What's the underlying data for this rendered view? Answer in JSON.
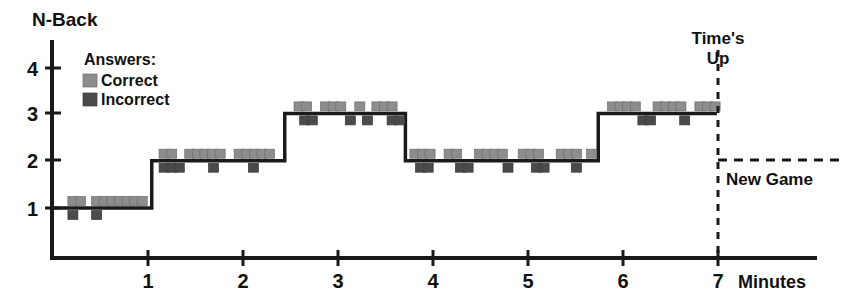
{
  "chart_data": {
    "type": "line",
    "title": "",
    "ylabel": "N-Back",
    "xlabel": "Minutes",
    "xlim": [
      0,
      8.0
    ],
    "ylim": [
      0,
      4.6
    ],
    "grid": false,
    "x_ticks": [
      1,
      2,
      3,
      4,
      5,
      6,
      7
    ],
    "x_tick_labels": [
      "1",
      "2",
      "3",
      "4",
      "5",
      "6",
      "7"
    ],
    "y_ticks": [
      1,
      2,
      3,
      4
    ],
    "y_tick_labels": [
      "1",
      "2",
      "3",
      "4"
    ],
    "legend": {
      "title": "Answers:",
      "position": "upper-left-inside",
      "entries": [
        {
          "label": "Correct",
          "color": "#8d8d8d"
        },
        {
          "label": "Incorrect",
          "color": "#4a4a4a"
        }
      ]
    },
    "series": [
      {
        "name": "N-Back level",
        "type": "step",
        "steps": [
          {
            "x_start": 0.0,
            "x_end": 1.05,
            "level": 1
          },
          {
            "x_start": 1.05,
            "x_end": 2.45,
            "level": 2
          },
          {
            "x_start": 2.45,
            "x_end": 3.72,
            "level": 3
          },
          {
            "x_start": 3.72,
            "x_end": 5.75,
            "level": 2
          },
          {
            "x_start": 5.75,
            "x_end": 7.0,
            "level": 3
          }
        ]
      }
    ],
    "markers": {
      "correct": {
        "description": "Light gray squares plotted just above the step line",
        "x": [
          0.22,
          0.3,
          0.47,
          0.55,
          0.63,
          0.71,
          0.79,
          0.87,
          0.95,
          1.18,
          1.26,
          1.45,
          1.53,
          1.61,
          1.69,
          1.77,
          1.97,
          2.05,
          2.13,
          2.21,
          2.29,
          2.6,
          2.68,
          2.88,
          2.96,
          3.04,
          3.24,
          3.42,
          3.5,
          3.58,
          3.82,
          3.9,
          3.98,
          4.18,
          4.26,
          4.5,
          4.58,
          4.66,
          4.74,
          4.96,
          5.04,
          5.12,
          5.36,
          5.44,
          5.52,
          5.68,
          5.9,
          5.98,
          6.06,
          6.14,
          6.38,
          6.46,
          6.54,
          6.62,
          6.82,
          6.9,
          6.98
        ]
      },
      "incorrect": {
        "description": "Dark gray squares plotted just below the step line",
        "x": [
          0.22,
          0.47,
          1.18,
          1.26,
          1.34,
          1.7,
          2.12,
          2.66,
          2.74,
          3.14,
          3.32,
          3.58,
          3.66,
          3.88,
          3.96,
          4.3,
          4.38,
          4.8,
          5.1,
          5.18,
          5.52,
          6.22,
          6.3,
          6.66
        ]
      }
    },
    "annotations": [
      {
        "name": "times-up",
        "text_lines": [
          "Time's",
          "Up"
        ],
        "x": 7.0,
        "style": "vertical-dashed-line"
      },
      {
        "name": "new-game",
        "text": "New Game",
        "y_level": 2,
        "x_from": 7.0,
        "style": "horizontal-dashed-line"
      }
    ]
  },
  "axes": {
    "y_title": "N-Back",
    "x_unit": "Minutes"
  },
  "legend": {
    "title": "Answers:",
    "correct_label": "Correct",
    "incorrect_label": "Incorrect"
  },
  "annotations": {
    "times_up_line1": "Time's",
    "times_up_line2": "Up",
    "new_game": "New Game"
  },
  "colors": {
    "correct": "#8d8d8d",
    "incorrect": "#4a4a4a",
    "ink": "#1a1a1a",
    "background": "#ffffff"
  }
}
